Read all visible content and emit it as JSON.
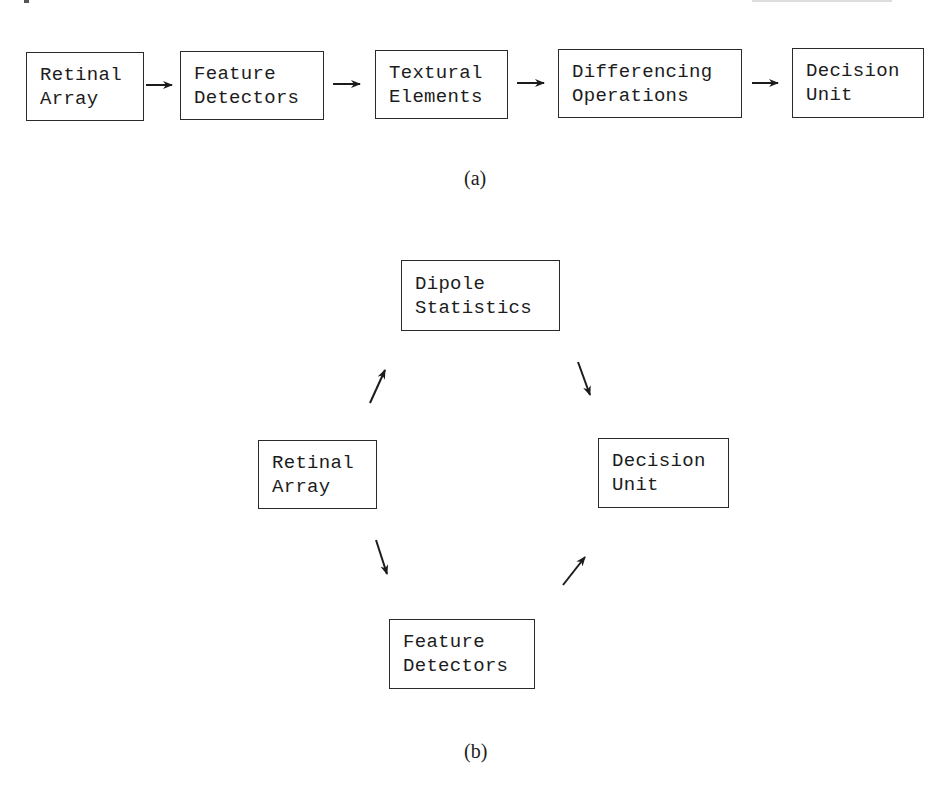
{
  "panel_a": {
    "caption": "(a)",
    "boxes": [
      {
        "line1": "Retinal",
        "line2": "Array"
      },
      {
        "line1": "Feature",
        "line2": "Detectors"
      },
      {
        "line1": "Textural",
        "line2": "Elements"
      },
      {
        "line1": "Differencing",
        "line2": "Operations"
      },
      {
        "line1": "Decision",
        "line2": "Unit"
      }
    ]
  },
  "panel_b": {
    "caption": "(b)",
    "boxes": {
      "dipole_statistics": {
        "line1": "Dipole",
        "line2": "Statistics"
      },
      "retinal_array": {
        "line1": "Retinal",
        "line2": "Array"
      },
      "decision_unit": {
        "line1": "Decision",
        "line2": "Unit"
      },
      "feature_detectors": {
        "line1": "Feature",
        "line2": "Detectors"
      }
    }
  },
  "colors": {
    "ink": "#1c1c1c",
    "background": "#ffffff"
  }
}
